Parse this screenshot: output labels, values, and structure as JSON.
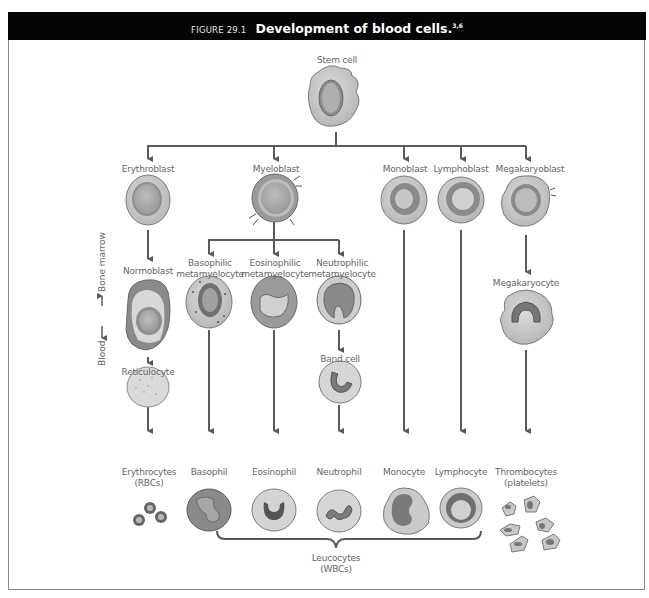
{
  "header": {
    "figure_number": "FIGURE 29.1",
    "title": "Development of blood cells.",
    "superscript": "3,6"
  },
  "side_label": {
    "bone_marrow": "Bone marrow",
    "blood": "Blood"
  },
  "nodes": {
    "stem_cell": "Stem cell",
    "erythroblast": "Erythroblast",
    "myeloblast": "Myeloblast",
    "monoblast": "Monoblast",
    "lymphoblast": "Lymphoblast",
    "megakaryoblast": "Megakaryoblast",
    "normoblast": "Normoblast",
    "basophilic_meta_1": "Basophilic",
    "basophilic_meta_2": "metamyelocyte",
    "eosinophilic_meta_1": "Eosinophilic",
    "eosinophilic_meta_2": "metamyelocyte",
    "neutrophilic_meta_1": "Neutrophilic",
    "neutrophilic_meta_2": "metamyelocyte",
    "megakaryocyte": "Megakaryocyte",
    "reticulocyte": "Reticulocyte",
    "band_cell": "Band cell",
    "erythrocytes_1": "Erythrocytes",
    "erythrocytes_2": "(RBCs)",
    "basophil": "Basophil",
    "eosinophil": "Eosinophil",
    "neutrophil": "Neutrophil",
    "monocyte": "Monocyte",
    "lymphocyte": "Lymphocyte",
    "thrombocytes_1": "Thrombocytes",
    "thrombocytes_2": "(platelets)",
    "leucocytes_1": "Leucocytes",
    "leucocytes_2": "(WBCs)"
  },
  "colors": {
    "header_bg": "#050505",
    "line": "#5a5a5a",
    "cell_outer": "#c9c9c9",
    "cell_mid": "#8f8f8f",
    "nucleus": "#a8a8a8",
    "nucleus_light": "#cfcfcf",
    "label": "#666666"
  }
}
